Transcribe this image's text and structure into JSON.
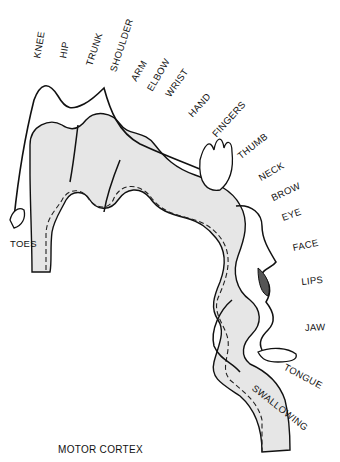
{
  "title": "MOTOR CORTEX",
  "labels": {
    "knee": "KNEE",
    "hip": "HIP",
    "trunk": "TRUNK",
    "shoulder": "SHOULDER",
    "arm": "ARM",
    "elbow": "ELBOW",
    "wrist": "WRIST",
    "hand": "HAND",
    "fingers": "FINGERS",
    "thumb": "THUMB",
    "neck": "NECK",
    "brow": "BROW",
    "eye": "EYE",
    "face": "FACE",
    "lips": "LIPS",
    "jaw": "JAW",
    "tongue": "TONGUE",
    "swallowing": "SWALLOWING",
    "toes": "TOES"
  },
  "colors": {
    "cortex_fill": "#e6e6e6",
    "outline": "#111111",
    "background": "#ffffff"
  }
}
